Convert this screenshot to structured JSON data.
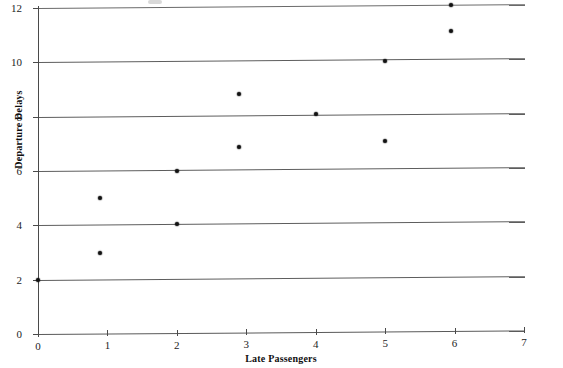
{
  "chart_data": {
    "type": "scatter",
    "title": "",
    "xlabel": "Late Passengers",
    "ylabel": "Departure Delays",
    "xlim": [
      0,
      7
    ],
    "ylim": [
      0,
      12
    ],
    "xticks": [
      0,
      1,
      2,
      3,
      4,
      5,
      6,
      7
    ],
    "yticks": [
      0,
      2,
      4,
      6,
      8,
      10,
      12
    ],
    "xtick_labels": [
      "0",
      "1",
      "2",
      "3",
      "4",
      "5",
      "6",
      "7"
    ],
    "ytick_labels": [
      "0",
      "2",
      "4",
      "6",
      "8",
      "10",
      "12"
    ],
    "grid": "horizontal",
    "gridlines_y": [
      2,
      4,
      6,
      8,
      10,
      12
    ],
    "legend": null,
    "marker": "circle",
    "marker_color": "#121212",
    "points": [
      {
        "x": 0.0,
        "y": 2.0
      },
      {
        "x": 0.9,
        "y": 5.0
      },
      {
        "x": 0.9,
        "y": 3.0
      },
      {
        "x": 2.0,
        "y": 6.0
      },
      {
        "x": 2.0,
        "y": 4.05
      },
      {
        "x": 2.9,
        "y": 8.85
      },
      {
        "x": 2.9,
        "y": 6.9
      },
      {
        "x": 4.0,
        "y": 8.1
      },
      {
        "x": 5.0,
        "y": 10.05
      },
      {
        "x": 5.0,
        "y": 7.1
      },
      {
        "x": 5.95,
        "y": 12.1
      },
      {
        "x": 5.95,
        "y": 11.15
      }
    ]
  },
  "colors": {
    "axis": "#4a4a4a",
    "gridline": "#5d5d5d",
    "marker": "#121212",
    "text": "#1a1a1a",
    "background": "#ffffff"
  }
}
